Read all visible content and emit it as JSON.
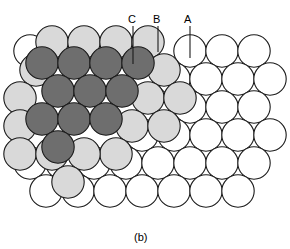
{
  "figure": {
    "caption": "(b)",
    "caption_x": 134,
    "caption_y": 232,
    "width": 290,
    "height": 249,
    "background": "#ffffff"
  },
  "palette": {
    "layer_a_fill": "#ffffff",
    "layer_b_fill": "#d9d9d9",
    "layer_c_fill": "#6e6e6e",
    "outline": "#1a1a1a",
    "leader_line": "#1a1a1a",
    "text": "#000000"
  },
  "geometry": {
    "radius": 16.2,
    "stroke_width": 1.1,
    "col_step": 32.0,
    "row_step": 27.7
  },
  "legend_labels": [
    {
      "id": "label-c",
      "text": "C",
      "text_x": 128,
      "text_y": 14,
      "line_x": 133,
      "line_y1": 26,
      "line_y2": 64
    },
    {
      "id": "label-b",
      "text": "B",
      "text_x": 153,
      "text_y": 14,
      "line_x": 158,
      "line_y1": 26,
      "line_y2": 52
    },
    {
      "id": "label-a",
      "text": "A",
      "text_x": 184,
      "text_y": 14,
      "line_x": 190,
      "line_y1": 26,
      "line_y2": 58
    }
  ],
  "layers": [
    {
      "name": "A",
      "role": "bottom-close-packed-plane",
      "fill": "#ffffff",
      "circles": [
        {
          "cx": 30,
          "cy": 51
        },
        {
          "cx": 190,
          "cy": 51
        },
        {
          "cx": 222,
          "cy": 51
        },
        {
          "cx": 254,
          "cy": 51
        },
        {
          "cx": 174,
          "cy": 79
        },
        {
          "cx": 206,
          "cy": 79
        },
        {
          "cx": 238,
          "cy": 79
        },
        {
          "cx": 270,
          "cy": 79
        },
        {
          "cx": 190,
          "cy": 107
        },
        {
          "cx": 222,
          "cy": 107
        },
        {
          "cx": 254,
          "cy": 107
        },
        {
          "cx": 142,
          "cy": 135
        },
        {
          "cx": 174,
          "cy": 135
        },
        {
          "cx": 206,
          "cy": 135
        },
        {
          "cx": 238,
          "cy": 135
        },
        {
          "cx": 270,
          "cy": 135
        },
        {
          "cx": 30,
          "cy": 163
        },
        {
          "cx": 62,
          "cy": 163
        },
        {
          "cx": 94,
          "cy": 163
        },
        {
          "cx": 126,
          "cy": 163
        },
        {
          "cx": 158,
          "cy": 163
        },
        {
          "cx": 190,
          "cy": 163
        },
        {
          "cx": 222,
          "cy": 163
        },
        {
          "cx": 254,
          "cy": 163
        },
        {
          "cx": 46,
          "cy": 191
        },
        {
          "cx": 78,
          "cy": 191
        },
        {
          "cx": 110,
          "cy": 191
        },
        {
          "cx": 142,
          "cy": 191
        },
        {
          "cx": 174,
          "cy": 191
        },
        {
          "cx": 206,
          "cy": 191
        },
        {
          "cx": 238,
          "cy": 191
        }
      ]
    },
    {
      "name": "B",
      "role": "middle-close-packed-plane",
      "fill": "#d9d9d9",
      "circles": [
        {
          "cx": 52,
          "cy": 42
        },
        {
          "cx": 84,
          "cy": 42
        },
        {
          "cx": 116,
          "cy": 42
        },
        {
          "cx": 148,
          "cy": 42
        },
        {
          "cx": 36,
          "cy": 70
        },
        {
          "cx": 164,
          "cy": 70
        },
        {
          "cx": 20,
          "cy": 98
        },
        {
          "cx": 148,
          "cy": 98
        },
        {
          "cx": 180,
          "cy": 98
        },
        {
          "cx": 132,
          "cy": 126
        },
        {
          "cx": 164,
          "cy": 126
        },
        {
          "cx": 20,
          "cy": 126
        },
        {
          "cx": 116,
          "cy": 154
        },
        {
          "cx": 20,
          "cy": 154
        },
        {
          "cx": 52,
          "cy": 154
        },
        {
          "cx": 84,
          "cy": 154
        },
        {
          "cx": 68,
          "cy": 182
        }
      ]
    },
    {
      "name": "C",
      "role": "top-close-packed-plane",
      "fill": "#6e6e6e",
      "circles": [
        {
          "cx": 42,
          "cy": 63
        },
        {
          "cx": 74,
          "cy": 63
        },
        {
          "cx": 106,
          "cy": 63
        },
        {
          "cx": 138,
          "cy": 63
        },
        {
          "cx": 58,
          "cy": 91
        },
        {
          "cx": 90,
          "cy": 91
        },
        {
          "cx": 122,
          "cy": 91
        },
        {
          "cx": 42,
          "cy": 119
        },
        {
          "cx": 74,
          "cy": 119
        },
        {
          "cx": 106,
          "cy": 119
        },
        {
          "cx": 58,
          "cy": 147
        }
      ]
    }
  ]
}
